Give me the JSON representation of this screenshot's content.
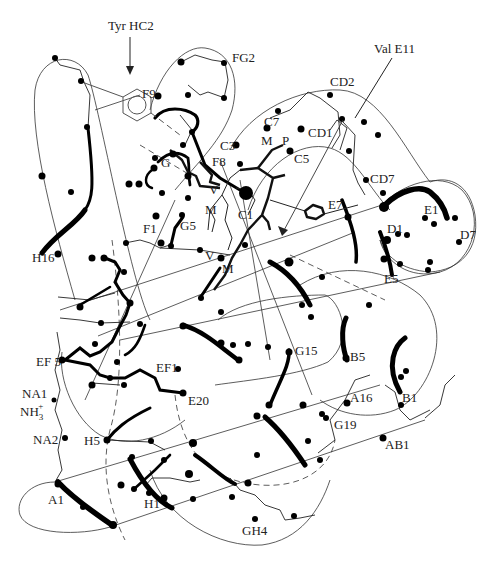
{
  "figure": {
    "type": "protein-fold-diagram",
    "annotations": {
      "tyr_hc2": "Tyr HC2",
      "val_e11": "Val E11"
    },
    "labels": {
      "FG2": "FG2",
      "F9": "F9",
      "CD2": "CD2",
      "C7": "C7",
      "CD1": "CD1",
      "C3": "C3",
      "M_top": "M",
      "P": "P",
      "C5": "C5",
      "G": "G",
      "F8": "F8",
      "V_top": "V",
      "CD7": "CD7",
      "E7": "E7",
      "E1": "E1",
      "M_mid": "M",
      "C1": "C1",
      "D1": "D1",
      "D7": "D7",
      "F1": "F1",
      "G5": "G5",
      "V_low": "V",
      "M_low": "M",
      "E5": "E5",
      "H16": "H16",
      "EF5": "EF 5",
      "EF1": "EF1",
      "G15": "G15",
      "B5": "B5",
      "E20": "E20",
      "NA1": "NA1",
      "NH3": "NH",
      "NH3_sub": "3",
      "NH3_sup": "+",
      "A16": "A16",
      "B1": "B1",
      "G19": "G19",
      "NA2": "NA2",
      "H5": "H5",
      "AB1": "AB1",
      "A1": "A1",
      "H1": "H1",
      "GH4": "GH4"
    },
    "helices": [
      "A",
      "B",
      "C",
      "D",
      "E",
      "F",
      "G",
      "H"
    ],
    "heme_ligands": [
      "M",
      "V",
      "P"
    ]
  }
}
